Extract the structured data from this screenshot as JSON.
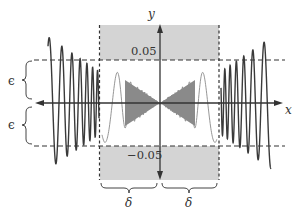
{
  "diagram": {
    "axes": {
      "x_label": "x",
      "y_label": "y"
    },
    "tick_labels": {
      "upper": "0.05",
      "lower": "−0.05"
    },
    "band_labels": {
      "upper_epsilon": "ϵ",
      "lower_epsilon": "ϵ"
    },
    "neighborhood_labels": {
      "left_delta": "δ",
      "right_delta": "δ"
    },
    "colors": {
      "shaded_region": "#d4d4d4",
      "curve_outer": "#3a3a3a",
      "curve_inner": "#8a8a8a",
      "axis": "#333333",
      "dashed": "#333333"
    }
  }
}
